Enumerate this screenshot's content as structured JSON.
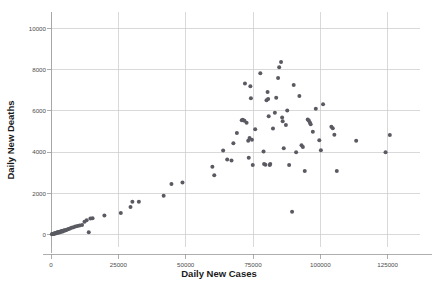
{
  "chart_data": {
    "type": "scatter",
    "title": "",
    "xlabel": "Daily New Cases",
    "ylabel": "Daily New Deaths",
    "xlim": [
      -3000,
      137000
    ],
    "ylim": [
      -600,
      10600
    ],
    "xticks": [
      0,
      25000,
      50000,
      75000,
      100000,
      125000
    ],
    "xtick_labels": [
      "0",
      "25000",
      "50000",
      "75000",
      "100000",
      "125000"
    ],
    "yticks": [
      0,
      2000,
      4000,
      6000,
      8000,
      10000
    ],
    "ytick_labels": [
      "0",
      "2000",
      "4000",
      "6000",
      "8000",
      "10000"
    ],
    "grid": true,
    "grid_color": "#c9c9c9",
    "legend": false,
    "marker_color": "#5a5a62",
    "marker_size": 4,
    "points": [
      [
        300,
        20
      ],
      [
        500,
        30
      ],
      [
        700,
        25
      ],
      [
        900,
        40
      ],
      [
        1100,
        50
      ],
      [
        1300,
        60
      ],
      [
        1500,
        55
      ],
      [
        1700,
        80
      ],
      [
        1900,
        70
      ],
      [
        2100,
        95
      ],
      [
        2300,
        110
      ],
      [
        2500,
        90
      ],
      [
        2700,
        120
      ],
      [
        2900,
        130
      ],
      [
        3100,
        105
      ],
      [
        3300,
        140
      ],
      [
        3500,
        150
      ],
      [
        3700,
        135
      ],
      [
        3900,
        160
      ],
      [
        4100,
        175
      ],
      [
        4300,
        155
      ],
      [
        4600,
        190
      ],
      [
        4900,
        210
      ],
      [
        5200,
        200
      ],
      [
        5600,
        230
      ],
      [
        6000,
        250
      ],
      [
        6500,
        270
      ],
      [
        7000,
        300
      ],
      [
        7600,
        330
      ],
      [
        8300,
        360
      ],
      [
        9000,
        390
      ],
      [
        9800,
        420
      ],
      [
        10600,
        440
      ],
      [
        11500,
        470
      ],
      [
        12400,
        620
      ],
      [
        13200,
        700
      ],
      [
        14000,
        120
      ],
      [
        14600,
        780
      ],
      [
        15400,
        800
      ],
      [
        19800,
        930
      ],
      [
        25900,
        1050
      ],
      [
        29500,
        1340
      ],
      [
        30200,
        1600
      ],
      [
        32600,
        1590
      ],
      [
        41800,
        1890
      ],
      [
        44700,
        2450
      ],
      [
        48800,
        2530
      ],
      [
        59900,
        3290
      ],
      [
        60600,
        2880
      ],
      [
        63900,
        4080
      ],
      [
        65400,
        3640
      ],
      [
        67000,
        3590
      ],
      [
        67700,
        4430
      ],
      [
        69000,
        4930
      ],
      [
        70800,
        5540
      ],
      [
        71200,
        5570
      ],
      [
        71800,
        5520
      ],
      [
        72000,
        7330
      ],
      [
        72600,
        5430
      ],
      [
        73200,
        4550
      ],
      [
        73400,
        3730
      ],
      [
        73700,
        4690
      ],
      [
        74000,
        7200
      ],
      [
        74200,
        6610
      ],
      [
        74600,
        4600
      ],
      [
        74900,
        3370
      ],
      [
        75800,
        5110
      ],
      [
        77700,
        7830
      ],
      [
        78900,
        4030
      ],
      [
        79100,
        3430
      ],
      [
        79600,
        3390
      ],
      [
        80000,
        6520
      ],
      [
        80400,
        6920
      ],
      [
        80600,
        6580
      ],
      [
        80800,
        5740
      ],
      [
        81200,
        3380
      ],
      [
        81400,
        3430
      ],
      [
        82400,
        5140
      ],
      [
        83100,
        5910
      ],
      [
        83600,
        6640
      ],
      [
        84300,
        7600
      ],
      [
        84700,
        8110
      ],
      [
        85400,
        8370
      ],
      [
        85800,
        5680
      ],
      [
        86000,
        5500
      ],
      [
        86400,
        4190
      ],
      [
        87200,
        5320
      ],
      [
        87700,
        6020
      ],
      [
        88400,
        3370
      ],
      [
        89500,
        1110
      ],
      [
        90100,
        7250
      ],
      [
        91000,
        3990
      ],
      [
        92200,
        6720
      ],
      [
        93000,
        4330
      ],
      [
        93500,
        4250
      ],
      [
        94200,
        3080
      ],
      [
        95300,
        5580
      ],
      [
        95700,
        5530
      ],
      [
        96100,
        5440
      ],
      [
        96400,
        5350
      ],
      [
        97200,
        4990
      ],
      [
        98300,
        6100
      ],
      [
        99600,
        4580
      ],
      [
        100200,
        4090
      ],
      [
        101000,
        6320
      ],
      [
        104100,
        5230
      ],
      [
        104600,
        5160
      ],
      [
        105200,
        4840
      ],
      [
        106100,
        3080
      ],
      [
        113300,
        4550
      ],
      [
        124200,
        4000
      ],
      [
        125800,
        4830
      ]
    ]
  }
}
